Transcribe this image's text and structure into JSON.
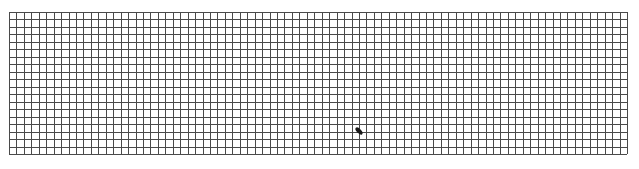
{
  "grid": {
    "origin_x": 9,
    "origin_y": 12,
    "width": 618,
    "height": 142,
    "columns": 83,
    "rows": 19,
    "line_color": "#4a4a4a",
    "line_width": 1,
    "background": "#ffffff"
  },
  "mark": {
    "cx": 359,
    "cy": 131,
    "color": "#1a1a1a",
    "shape": "pen-stroke-blob"
  }
}
